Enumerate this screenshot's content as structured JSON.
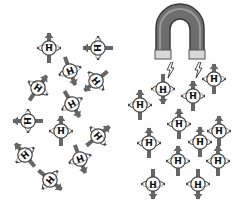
{
  "diagram": {
    "colors": {
      "arrow": "#666666",
      "atom_fill": "#ffffff",
      "atom_ring": "#444444",
      "magnet_body": "#6e6e6e",
      "magnet_dark": "#3c3c3c",
      "magnet_pole": "#d8d8d8"
    },
    "atom_label": "H",
    "left_group": {
      "name": "random-orientation",
      "atoms": [
        {
          "x": 49,
          "y": 48,
          "rot": 0,
          "label": "H"
        },
        {
          "x": 98,
          "y": 48,
          "rot": -90,
          "label": "H"
        },
        {
          "x": 70,
          "y": 71,
          "rot": 160,
          "label": "H"
        },
        {
          "x": 96,
          "y": 81,
          "rot": -130,
          "label": "H"
        },
        {
          "x": 38,
          "y": 88,
          "rot": 35,
          "label": "H"
        },
        {
          "x": 72,
          "y": 104,
          "rot": 150,
          "label": "H"
        },
        {
          "x": 28,
          "y": 121,
          "rot": -90,
          "label": "H"
        },
        {
          "x": 61,
          "y": 131,
          "rot": 0,
          "label": "H"
        },
        {
          "x": 98,
          "y": 136,
          "rot": 50,
          "label": "H"
        },
        {
          "x": 25,
          "y": 155,
          "rot": -40,
          "label": "H"
        },
        {
          "x": 80,
          "y": 159,
          "rot": 160,
          "label": "H"
        },
        {
          "x": 50,
          "y": 180,
          "rot": 130,
          "label": "H"
        }
      ]
    },
    "right_group": {
      "name": "aligned-in-field",
      "magnet": {
        "type": "horseshoe",
        "orientation": "poles-down"
      },
      "field_bolts": [
        {
          "x": 165,
          "y": 62
        },
        {
          "x": 193,
          "y": 62
        }
      ],
      "atoms": [
        {
          "x": 163,
          "y": 89,
          "rot": 180,
          "label": "H"
        },
        {
          "x": 214,
          "y": 79,
          "rot": 0,
          "label": "H"
        },
        {
          "x": 140,
          "y": 105,
          "rot": 0,
          "label": "H"
        },
        {
          "x": 193,
          "y": 96,
          "rot": 0,
          "label": "H"
        },
        {
          "x": 179,
          "y": 124,
          "rot": 0,
          "label": "H"
        },
        {
          "x": 219,
          "y": 131,
          "rot": 0,
          "label": "H"
        },
        {
          "x": 149,
          "y": 143,
          "rot": 0,
          "label": "H"
        },
        {
          "x": 200,
          "y": 142,
          "rot": 0,
          "label": "H"
        },
        {
          "x": 178,
          "y": 161,
          "rot": 0,
          "label": "H"
        },
        {
          "x": 218,
          "y": 161,
          "rot": 0,
          "label": "H"
        },
        {
          "x": 153,
          "y": 184,
          "rot": 180,
          "label": "H"
        },
        {
          "x": 198,
          "y": 184,
          "rot": 180,
          "label": "H"
        }
      ]
    }
  }
}
